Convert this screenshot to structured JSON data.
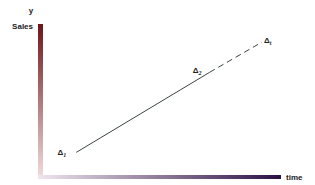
{
  "chart_data": {
    "type": "line",
    "title": "",
    "xlabel": "time",
    "ylabel": "y",
    "ylabel_secondary": "Sales",
    "grid": false,
    "legend": "none",
    "xlim": [
      0,
      10
    ],
    "ylim": [
      0,
      10
    ],
    "series": [
      {
        "name": "actual",
        "style": "solid",
        "points": [
          {
            "x": 1.4,
            "y": 1.5,
            "label": "Δ",
            "sub": "1"
          },
          {
            "x": 7.0,
            "y": 6.8,
            "label": "Δ",
            "sub": "2"
          }
        ]
      },
      {
        "name": "projected",
        "style": "dashed",
        "points": [
          {
            "x": 7.0,
            "y": 6.8
          },
          {
            "x": 9.2,
            "y": 8.8,
            "label": "Δ",
            "sub": "t"
          }
        ]
      }
    ]
  },
  "colors": {
    "y_axis_top": "#6e1518",
    "y_axis_bottom": "#f2dede",
    "x_axis_left": "#f0e6ee",
    "x_axis_right": "#2c1045",
    "line": "#3b463e",
    "text": "#222222"
  }
}
